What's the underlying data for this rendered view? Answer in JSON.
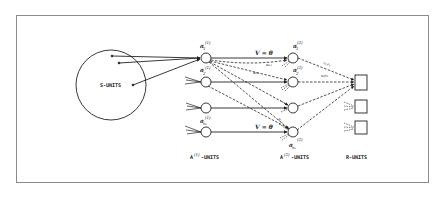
{
  "diagram": {
    "s_units_label": "S-UNITS",
    "layer_labels": {
      "a1": "A",
      "a1_sup": "(1)",
      "a1_suffix": "-UNITS",
      "a2": "A",
      "a2_sup": "(2)",
      "a2_suffix": "-UNITS",
      "r": "R-UNITS"
    },
    "a1_nodes": [
      {
        "sym": "a",
        "sub": "1",
        "sup": "(1)"
      },
      {
        "sym": "a",
        "sub": "2",
        "sup": "(1)"
      },
      {
        "sym": "",
        "sub": "",
        "sup": ""
      },
      {
        "sym": "a",
        "sub": "nₐ",
        "sup": "(1)"
      }
    ],
    "a2_nodes": [
      {
        "sym": "a",
        "sub": "1",
        "sup": "(2)"
      },
      {
        "sym": "a",
        "sub": "2",
        "sup": "(2)"
      },
      {
        "sym": "",
        "sub": "",
        "sup": ""
      },
      {
        "sym": "a",
        "sub": "nₐ",
        "sup": "(2)"
      }
    ],
    "edge_labels": {
      "v_top": "V = θ",
      "v_bottom": "V = θ",
      "u11": "u₁₁",
      "u12": "u₁₂",
      "u1n": "u₁ₙ",
      "v1r1": "v₁r₁",
      "v2r1": "v₂r₁"
    },
    "colors": {
      "line": "#222222",
      "frame": "#8a8a8a",
      "background": "#ffffff"
    }
  }
}
